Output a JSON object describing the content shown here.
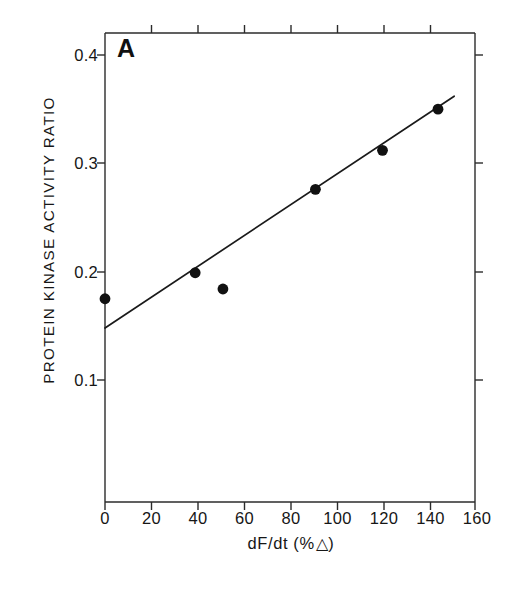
{
  "figure": {
    "panel_letter": "A",
    "ylabel": "PROTEIN KINASE ACTIVITY RATIO",
    "xlabel_prefix": "dF/dt (%",
    "xlabel_delta": "△",
    "xlabel_suffix": ")",
    "xlabel_full": "dF/dt (% △)",
    "line_color": "#1a1a1a",
    "marker_color": "#111111",
    "axis_color": "#2b2b2b"
  },
  "chart_data": {
    "type": "scatter",
    "title": "A",
    "xlabel": "dF/dt (% △)",
    "ylabel": "PROTEIN KINASE ACTIVITY RATIO",
    "xlim": [
      0,
      160
    ],
    "ylim": [
      0.05,
      0.43
    ],
    "grid": false,
    "legend": "none",
    "xticks": [
      0,
      20,
      40,
      60,
      80,
      100,
      120,
      140,
      160
    ],
    "xtick_labels": [
      "0",
      "20",
      "40",
      "60",
      "80",
      "100",
      "120",
      "140",
      "160"
    ],
    "yticks": [
      0.1,
      0.2,
      0.3,
      0.4
    ],
    "ytick_labels": [
      "0.1",
      "0.2",
      "0.3",
      "0.4"
    ],
    "points": [
      {
        "x": 0,
        "y": 0.175
      },
      {
        "x": 39,
        "y": 0.199
      },
      {
        "x": 51,
        "y": 0.184
      },
      {
        "x": 91,
        "y": 0.276
      },
      {
        "x": 120,
        "y": 0.312
      },
      {
        "x": 144,
        "y": 0.35
      }
    ],
    "x": [
      0,
      39,
      51,
      91,
      120,
      144
    ],
    "y": [
      0.175,
      0.199,
      0.184,
      0.276,
      0.312,
      0.35
    ],
    "fit_line": {
      "type": "linear-regression",
      "x_start": 0,
      "y_start": 0.148,
      "x_end": 151,
      "y_end": 0.362
    }
  }
}
